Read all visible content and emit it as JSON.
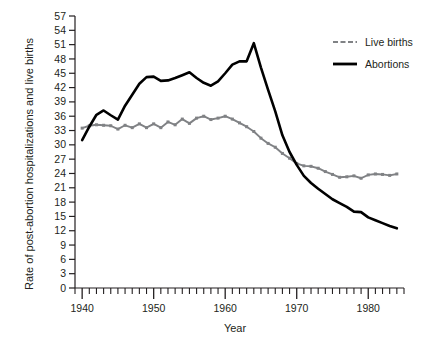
{
  "chart_data": {
    "type": "line",
    "title": "",
    "xlabel": "Year",
    "ylabel": "Rate of post-abortion hospitalizations and live births",
    "xlim": [
      1939,
      1985
    ],
    "ylim": [
      0,
      57
    ],
    "grid": false,
    "legend_position": "top-right",
    "yticks": [
      0,
      3,
      6,
      9,
      12,
      15,
      18,
      21,
      24,
      27,
      30,
      33,
      36,
      39,
      42,
      45,
      48,
      51,
      54,
      57
    ],
    "ytick_labels": [
      "0",
      "3",
      "6",
      "9",
      "12",
      "15",
      "18",
      "21",
      "24",
      "27",
      "30",
      "33",
      "36",
      "39",
      "42",
      "45",
      "48",
      "51",
      "54",
      "57"
    ],
    "xticks_major": [
      1940,
      1950,
      1960,
      1970,
      1980
    ],
    "xtick_labels": [
      "1940",
      "1950",
      "1960",
      "1970",
      "1980"
    ],
    "xticks_minor_step": 1,
    "x": [
      1940,
      1941,
      1942,
      1943,
      1944,
      1945,
      1946,
      1947,
      1948,
      1949,
      1950,
      1951,
      1952,
      1953,
      1954,
      1955,
      1956,
      1957,
      1958,
      1959,
      1960,
      1961,
      1962,
      1963,
      1964,
      1965,
      1966,
      1967,
      1968,
      1969,
      1970,
      1971,
      1972,
      1973,
      1974,
      1975,
      1976,
      1977,
      1978,
      1979,
      1980,
      1981,
      1982,
      1983,
      1984
    ],
    "series": [
      {
        "name": "Live births",
        "color": "#808285",
        "style": "line-with-markers",
        "values": [
          33.5,
          34.0,
          34.2,
          34.1,
          34.0,
          33.3,
          34.1,
          33.6,
          34.4,
          33.6,
          34.4,
          33.6,
          34.8,
          34.2,
          35.4,
          34.5,
          35.6,
          36.0,
          35.3,
          35.6,
          36.0,
          35.4,
          34.6,
          33.8,
          32.8,
          31.4,
          30.3,
          29.5,
          28.2,
          27.2,
          26.1,
          25.6,
          25.5,
          25.1,
          24.4,
          23.8,
          23.2,
          23.3,
          23.5,
          23.0,
          23.7,
          23.9,
          23.8,
          23.6,
          23.9
        ]
      },
      {
        "name": "Abortions",
        "color": "#000000",
        "style": "line",
        "values": [
          31.0,
          33.8,
          36.3,
          37.2,
          36.2,
          35.3,
          38.2,
          40.5,
          42.8,
          44.2,
          44.3,
          43.4,
          43.5,
          44.0,
          44.6,
          45.2,
          44.0,
          43.0,
          42.4,
          43.3,
          45.0,
          46.8,
          47.5,
          47.5,
          51.3,
          46.2,
          41.5,
          37.0,
          32.0,
          28.5,
          25.8,
          23.5,
          22.0,
          20.8,
          19.7,
          18.6,
          17.8,
          17.0,
          16.0,
          15.9,
          14.8,
          14.2,
          13.6,
          13.0,
          12.5
        ]
      }
    ]
  },
  "legend": {
    "items": [
      {
        "label": "Live births",
        "color": "#808285",
        "dashed": true
      },
      {
        "label": "Abortions",
        "color": "#000000",
        "dashed": false
      }
    ]
  }
}
